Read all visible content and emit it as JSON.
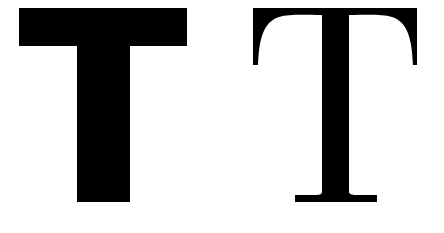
{
  "figure": {
    "background": "#ffffff",
    "ink": "#000000",
    "glyphs": [
      {
        "character": "T",
        "style": "sans-serif",
        "weight": "heavy",
        "description": "Bold sans-serif capital T"
      },
      {
        "character": "T",
        "style": "serif",
        "weight": "regular",
        "description": "Serif capital T with bracketed serifs"
      }
    ]
  }
}
